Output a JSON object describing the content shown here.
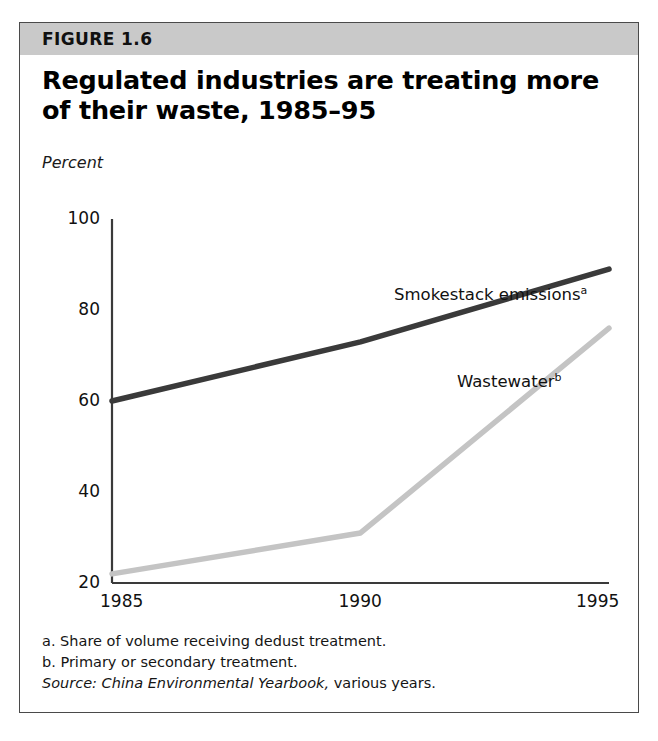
{
  "figure": {
    "label": "FIGURE 1.6",
    "title": "Regulated industries are treating more of their waste, 1985–95",
    "band_color": "#c9c9c9",
    "border_color": "#4a4a4a"
  },
  "notes": {
    "a": "a. Share of volume receiving dedust treatment.",
    "b": "b. Primary or secondary treatment.",
    "source_prefix": "Source: China Environmental Yearbook,",
    "source_suffix": "various years."
  },
  "chart_data": {
    "type": "line",
    "title": "Regulated industries are treating more of their waste, 1985–95",
    "xlabel": "",
    "ylabel": "Percent",
    "ylabel_style": "italic",
    "x": [
      1985,
      1990,
      1995
    ],
    "xticks": [
      "1985",
      "1990",
      "1995"
    ],
    "yticks": [
      20,
      40,
      60,
      80,
      100
    ],
    "ytick_labels": [
      "20",
      "40",
      "60",
      "80",
      "100"
    ],
    "ylim": [
      20,
      100
    ],
    "xlim": [
      1985,
      1995
    ],
    "grid": false,
    "legend": "inline-annotations",
    "series": [
      {
        "name": "Smokestack emissions",
        "footnote_marker": "a",
        "values": [
          60,
          73,
          89
        ],
        "color": "#3a3a3a",
        "width": 5.5,
        "label_x": 374,
        "label_y": 262
      },
      {
        "name": "Wastewater",
        "footnote_marker": "b",
        "values": [
          22,
          31,
          76
        ],
        "color": "#c4c4c4",
        "width": 5.5,
        "label_x": 437,
        "label_y": 349
      }
    ]
  }
}
